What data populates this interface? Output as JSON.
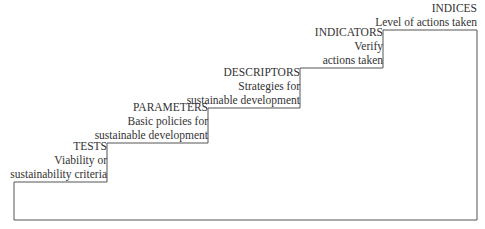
{
  "diagram": {
    "type": "staircase",
    "line_color": "#555555",
    "steps": [
      {
        "title": "TESTS",
        "lines": [
          "Viability or",
          "sustainability criteria"
        ]
      },
      {
        "title": "PARAMETERS",
        "lines": [
          "Basic policies for",
          "sustainable development"
        ]
      },
      {
        "title": "DESCRIPTORS",
        "lines": [
          "Strategies for",
          "sustainable development"
        ]
      },
      {
        "title": "INDICATORS",
        "lines": [
          "Verify",
          "actions taken"
        ]
      },
      {
        "title": "INDICES",
        "lines": [
          "Level of actions taken"
        ]
      }
    ]
  }
}
